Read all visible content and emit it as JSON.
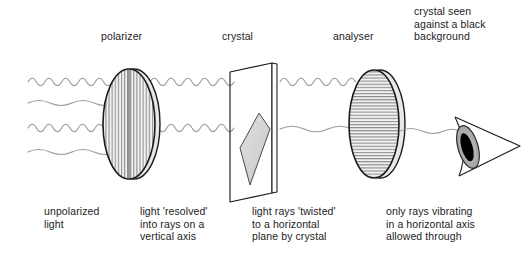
{
  "figure": {
    "background_color": "#ffffff",
    "ink_color": "#1c1c1c",
    "wave_color": "#9a9a9a",
    "crystal_fill": "#d6d6d6",
    "pupil_color": "#000000"
  },
  "top_labels": {
    "polarizer": "polarizer",
    "crystal": "crystal",
    "analyser": "analyser",
    "crystal_seen": "crystal seen\nagainst a black\nbackground"
  },
  "bottom_labels": {
    "unpolarized": "unpolarized\nlight",
    "resolved": "light 'resolved'\ninto rays on a\nvertical  axis",
    "twisted": "light rays 'twisted'\nto a horizontal\nplane by crystal",
    "vibrating": "only rays vibrating\nin a horizontal axis\nallowed through"
  },
  "optics": {
    "polarizer": {
      "name": "polarizer",
      "axis": "vertical",
      "hatch": "vertical-lines",
      "center_x": 130,
      "center_y": 124,
      "rx": 27,
      "ry": 55
    },
    "analyser": {
      "name": "analyser",
      "axis": "horizontal",
      "hatch": "horizontal-lines",
      "center_x": 375,
      "center_y": 124,
      "rx": 26,
      "ry": 54
    },
    "crystal_slide": {
      "name": "crystal on slide",
      "shape": "3d-plate",
      "crystal_fill": "#d6d6d6"
    },
    "eye": {
      "name": "observer eye",
      "center_x": 468,
      "center_y": 147,
      "pupil": "black"
    }
  },
  "wave_segments": [
    {
      "zone": "before-polarizer",
      "rows": 4,
      "types": [
        "tight",
        "gentle",
        "tight",
        "gentle"
      ],
      "meaning": "unpolarized light"
    },
    {
      "zone": "polarizer-to-crystal",
      "rows": 2,
      "types": [
        "tight",
        "tight"
      ],
      "meaning": "rays on a vertical axis"
    },
    {
      "zone": "crystal-to-analyser",
      "rows": 2,
      "types": [
        "tight",
        "gentle"
      ],
      "meaning": "rays twisted to a horizontal plane"
    },
    {
      "zone": "after-analyser",
      "rows": 1,
      "types": [
        "gentle"
      ],
      "meaning": "only horizontal-axis rays pass"
    }
  ]
}
